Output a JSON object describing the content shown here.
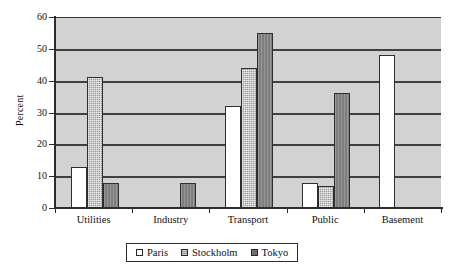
{
  "chart_data": {
    "type": "bar",
    "title": "",
    "xlabel": "",
    "ylabel": "Percent",
    "ylim": [
      0,
      60
    ],
    "yticks": [
      0,
      10,
      20,
      30,
      40,
      50,
      60
    ],
    "grid": true,
    "legend_position": "bottom",
    "categories": [
      "Utilities",
      "Industry",
      "Transport",
      "Public",
      "Basement"
    ],
    "series": [
      {
        "name": "Paris",
        "values": [
          13,
          null,
          32,
          8,
          48
        ]
      },
      {
        "name": "Stockholm",
        "values": [
          41,
          null,
          44,
          7,
          null
        ]
      },
      {
        "name": "Tokyo",
        "values": [
          8,
          8,
          55,
          36,
          null
        ]
      }
    ]
  },
  "legend": {
    "items": [
      {
        "label": "Paris",
        "swatch": "series-paris"
      },
      {
        "label": "Stockholm",
        "swatch": "series-stockholm"
      },
      {
        "label": "Tokyo",
        "swatch": "series-tokyo"
      }
    ]
  },
  "colors": {
    "plot_background": "#d2d2d2",
    "gridline": "#3f3f3f",
    "axis": "#2b2b2b",
    "paris": "#ffffff",
    "stockholm": "#9a9a9a",
    "tokyo": "#7e7e7e",
    "text": "#111111"
  }
}
